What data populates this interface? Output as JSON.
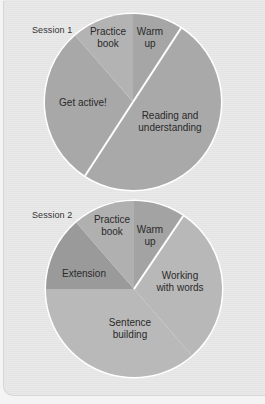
{
  "chart_data": [
    {
      "type": "pie",
      "title": "Session 1",
      "start_angle_deg": 0,
      "direction": "clockwise",
      "center": [
        133,
        102
      ],
      "radius": 88,
      "slices": [
        {
          "label": "Warm up",
          "lines": [
            "Warm",
            "up"
          ],
          "degrees": 33,
          "percent": 9,
          "color": "#a6a6a6",
          "label_pos": [
            150,
            38
          ],
          "separator": true
        },
        {
          "label": "Reading and understanding",
          "lines": [
            "Reading and",
            "understanding"
          ],
          "degrees": 180,
          "percent": 50,
          "color": "#a9a9a9",
          "label_pos": [
            170,
            122
          ],
          "separator": true
        },
        {
          "label": "Get active!",
          "lines": [
            "Get active!"
          ],
          "degrees": 106,
          "percent": 29,
          "color": "#a8a8a8",
          "label_pos": [
            83,
            103
          ],
          "separator": false
        },
        {
          "label": "Practice book",
          "lines": [
            "Practice",
            "book"
          ],
          "degrees": 41,
          "percent": 11,
          "color": "#b3b3b3",
          "label_pos": [
            108,
            38
          ],
          "separator": false
        }
      ]
    },
    {
      "type": "pie",
      "title": "Session 2",
      "start_angle_deg": 0,
      "direction": "clockwise",
      "center": [
        134,
        289
      ],
      "radius": 88,
      "slices": [
        {
          "label": "Warm up",
          "lines": [
            "Warm",
            "up"
          ],
          "degrees": 34,
          "percent": 9,
          "color": "#a3a3a3",
          "label_pos": [
            150,
            236
          ],
          "separator": true
        },
        {
          "label": "Working with words",
          "lines": [
            "Working",
            "with words"
          ],
          "degrees": 105,
          "percent": 29,
          "color": "#b8b8b8",
          "label_pos": [
            180,
            282
          ],
          "separator": false
        },
        {
          "label": "Sentence building",
          "lines": [
            "Sentence",
            "building"
          ],
          "degrees": 131,
          "percent": 36,
          "color": "#b9b9b9",
          "label_pos": [
            130,
            329
          ],
          "separator": false
        },
        {
          "label": "Extension",
          "lines": [
            "Extension"
          ],
          "degrees": 49,
          "percent": 14,
          "color": "#9a9a9a",
          "label_pos": [
            84,
            274
          ],
          "separator": false
        },
        {
          "label": "Practice book",
          "lines": [
            "Practice",
            "book"
          ],
          "degrees": 41,
          "percent": 11,
          "color": "#b0b0b0",
          "label_pos": [
            112,
            226
          ],
          "separator": false
        }
      ]
    }
  ],
  "labels": {
    "session1": "Session 1",
    "session2": "Session 2"
  }
}
